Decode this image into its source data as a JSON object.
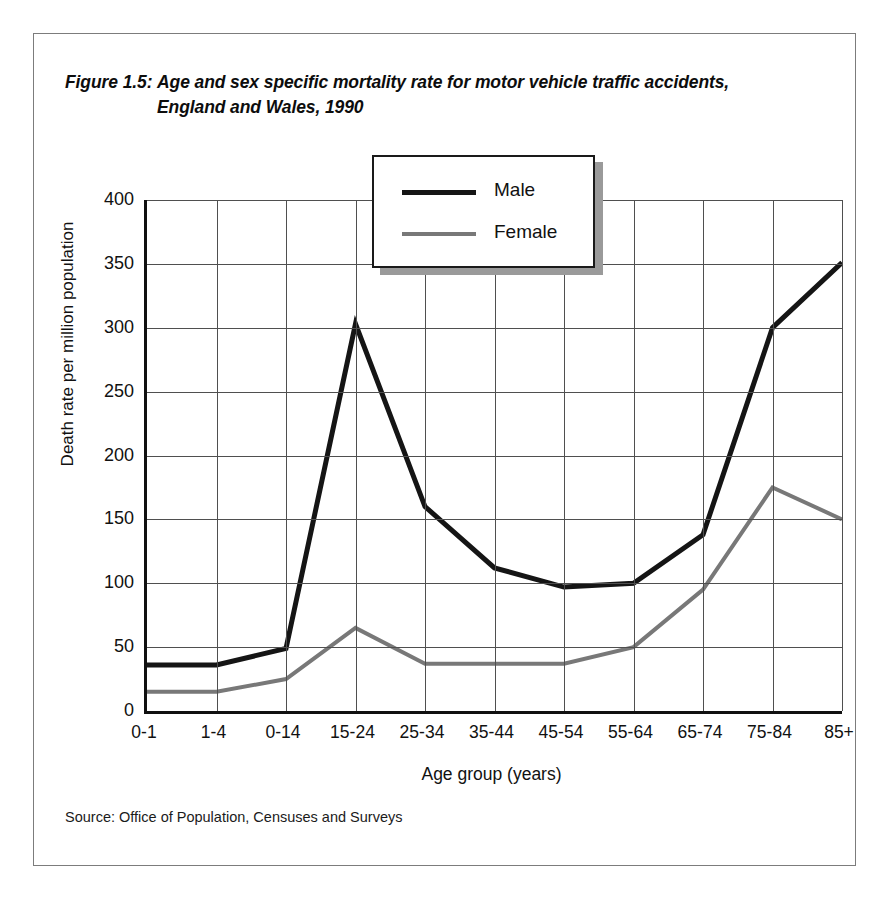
{
  "figure": {
    "label": "Figure 1.5:",
    "title": "Age and sex specific mortality rate for motor vehicle traffic accidents, England and Wales, 1990",
    "source": "Source: Office of Population, Censuses and Surveys"
  },
  "legend": {
    "position": "top-center",
    "entries": [
      {
        "label": "Male",
        "color": "#151515"
      },
      {
        "label": "Female",
        "color": "#787878"
      }
    ]
  },
  "chart_data": {
    "type": "line",
    "title": "Age and sex specific mortality rate for motor vehicle traffic accidents, England and Wales, 1990",
    "xlabel": "Age group (years)",
    "ylabel": "Death rate per million population",
    "categories": [
      "0-1",
      "1-4",
      "0-14",
      "15-24",
      "25-34",
      "35-44",
      "45-54",
      "55-64",
      "65-74",
      "75-84",
      "85+"
    ],
    "ylim": [
      0,
      400
    ],
    "yticks": [
      0,
      50,
      100,
      150,
      200,
      250,
      300,
      350,
      400
    ],
    "grid": true,
    "series": [
      {
        "name": "Male",
        "color": "#151515",
        "values": [
          36,
          36,
          49,
          303,
          160,
          112,
          97,
          100,
          138,
          300,
          351
        ]
      },
      {
        "name": "Female",
        "color": "#787878",
        "values": [
          15,
          15,
          25,
          65,
          37,
          37,
          37,
          50,
          95,
          175,
          150
        ]
      }
    ]
  }
}
